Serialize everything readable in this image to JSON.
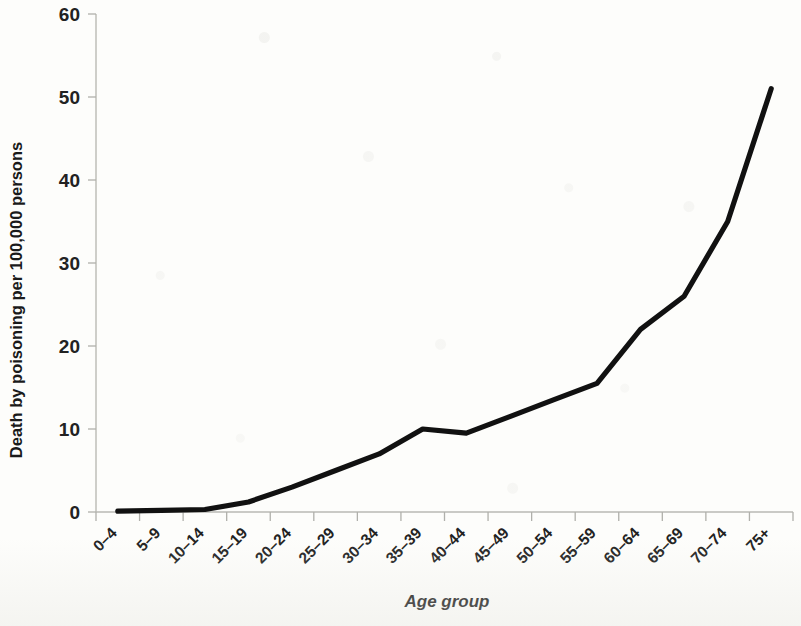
{
  "chart_data": {
    "type": "line",
    "title": "",
    "subtitle": "",
    "xlabel": "Age group",
    "ylabel": "Death by poisoning per 100,000 persons",
    "categories": [
      "0–4",
      "5–9",
      "10–14",
      "15–19",
      "20–24",
      "25–29",
      "30–34",
      "35–39",
      "40–44",
      "45–49",
      "50–54",
      "55–59",
      "60–64",
      "65–69",
      "70–74",
      "75+"
    ],
    "values": [
      0.1,
      0.2,
      0.3,
      1.2,
      3.0,
      5.0,
      7.0,
      10.0,
      9.5,
      11.5,
      13.5,
      15.5,
      22.0,
      26.0,
      35.0,
      51.0
    ],
    "series": [
      {
        "name": "Death by poisoning per 100,000 persons",
        "values": [
          0.1,
          0.2,
          0.3,
          1.2,
          3.0,
          5.0,
          7.0,
          10.0,
          9.5,
          11.5,
          13.5,
          15.5,
          22.0,
          26.0,
          35.0,
          51.0
        ]
      }
    ],
    "ylim": [
      0,
      60
    ],
    "ytick_labels": [
      "0",
      "10",
      "20",
      "30",
      "40",
      "50",
      "60"
    ],
    "ytick_values": [
      0,
      10,
      20,
      30,
      40,
      50,
      60
    ],
    "grid": false,
    "legend": false,
    "legend_position": "none",
    "line_color": "#111111",
    "axis_color": "#b9b9b4",
    "background_color": "#fdfdfb",
    "xlabel_rotation": 45
  }
}
